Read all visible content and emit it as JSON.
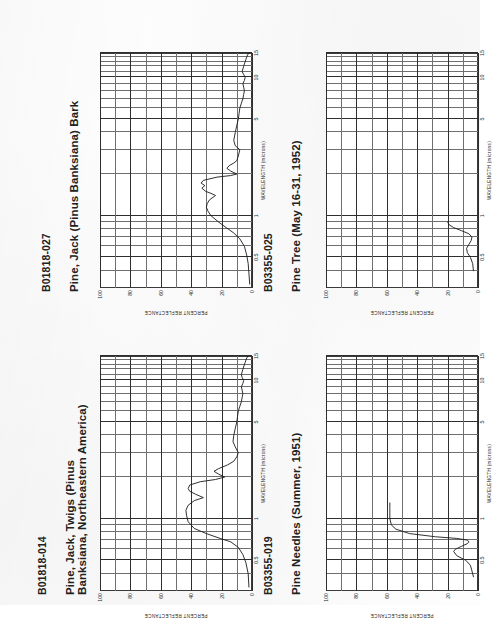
{
  "page": {
    "kind": "scanned-spectral-reflectance-catalog-page",
    "background_color": "#fdfdfd",
    "ink_color": "#212121",
    "orientation_note": "charts rotated 90 degrees counter-clockwise on page"
  },
  "axes_common": {
    "xlabel": "WAVELENGTH (microns)",
    "ylabel": "PERCENT REFLECTANCE",
    "xticks": [
      "0.5",
      "1",
      "5",
      "10",
      "15"
    ],
    "xtick_values": [
      0.5,
      1,
      5,
      10,
      15
    ],
    "yticks": [
      "0",
      "20",
      "40",
      "60",
      "80",
      "100"
    ],
    "ytick_values": [
      0,
      20,
      40,
      60,
      80,
      100
    ],
    "xlim": [
      0.3,
      15
    ],
    "ylim": [
      0,
      100
    ],
    "xscale": "log-to-linear segmented",
    "grid": true
  },
  "panels": [
    {
      "position": "top-left",
      "id_label": "B01818-027",
      "title": "Pine, Jack (Pinus Banksiana) Bark",
      "chart_data": {
        "type": "line",
        "title": "Pine, Jack (Pinus Banksiana) Bark",
        "xlabel": "WAVELENGTH (microns)",
        "ylabel": "PERCENT REFLECTANCE",
        "xlim": [
          0.3,
          15
        ],
        "ylim": [
          0,
          100
        ],
        "grid": true,
        "series": [
          {
            "name": "B01818-027",
            "x": [
              0.32,
              0.38,
              0.45,
              0.52,
              0.6,
              0.68,
              0.75,
              0.82,
              0.9,
              1.0,
              1.08,
              1.15,
              1.22,
              1.3,
              1.4,
              1.45,
              1.5,
              1.58,
              1.65,
              1.72,
              1.8,
              1.9,
              1.95,
              2.0,
              2.1,
              2.2,
              2.3,
              2.4,
              2.5,
              2.7,
              3.0,
              3.2,
              3.5,
              4.0,
              4.5,
              5.0,
              5.5,
              6.0,
              6.5,
              7.0,
              7.5,
              8.0,
              8.5,
              9.0,
              9.5,
              10.0,
              10.5,
              11.0,
              11.5,
              12.0,
              12.5,
              13.0,
              13.5,
              14.0,
              14.5,
              15.0
            ],
            "y": [
              1.5,
              2.0,
              2.5,
              3.5,
              5.0,
              8.0,
              12.0,
              17.0,
              22.0,
              27.0,
              29.0,
              30.0,
              29.5,
              28.0,
              24.0,
              27.0,
              30.5,
              33.0,
              31.0,
              33.5,
              32.0,
              23.0,
              14.0,
              10.0,
              14.0,
              16.5,
              15.0,
              12.0,
              10.0,
              9.0,
              8.0,
              11.0,
              12.0,
              11.0,
              10.0,
              9.0,
              8.5,
              8.0,
              7.0,
              6.0,
              5.5,
              5.0,
              5.5,
              6.0,
              5.0,
              4.5,
              5.5,
              6.5,
              6.0,
              5.5,
              5.0,
              4.5,
              4.0,
              3.5,
              3.0,
              2.0
            ]
          }
        ]
      }
    },
    {
      "position": "bottom-left",
      "id_label": "B01818-014",
      "title": "Pine, Jack, Twigs (Pinus",
      "title_line2": "Banksiana, Northeastern America)",
      "chart_data": {
        "type": "line",
        "title": "Pine, Jack, Twigs (Pinus Banksiana, Northeastern America)",
        "xlabel": "WAVELENGTH (microns)",
        "ylabel": "PERCENT REFLECTANCE",
        "xlim": [
          0.3,
          15
        ],
        "ylim": [
          0,
          100
        ],
        "grid": true,
        "series": [
          {
            "name": "B01818-014",
            "x": [
              0.32,
              0.4,
              0.48,
              0.55,
              0.62,
              0.68,
              0.72,
              0.78,
              0.85,
              0.95,
              1.05,
              1.15,
              1.25,
              1.35,
              1.42,
              1.5,
              1.58,
              1.65,
              1.75,
              1.85,
              1.92,
              2.0,
              2.1,
              2.2,
              2.3,
              2.45,
              2.6,
              2.8,
              3.0,
              3.3,
              3.6,
              4.0,
              4.5,
              5.0,
              5.5,
              6.0,
              6.5,
              7.0,
              7.5,
              8.0,
              8.5,
              9.0,
              9.5,
              10.0,
              10.5,
              11.0,
              11.5,
              12.0,
              12.5,
              13.0,
              13.5,
              14.0,
              14.5,
              15.0
            ],
            "y": [
              2.0,
              2.5,
              4.0,
              6.0,
              9.0,
              14.0,
              21.0,
              30.0,
              38.0,
              42.0,
              43.0,
              43.5,
              42.0,
              38.0,
              32.0,
              37.0,
              41.0,
              42.0,
              41.0,
              34.0,
              24.0,
              18.0,
              22.0,
              25.0,
              22.0,
              16.0,
              12.0,
              10.0,
              9.0,
              11.0,
              12.5,
              12.0,
              11.0,
              10.0,
              9.5,
              9.0,
              8.0,
              7.0,
              6.5,
              6.0,
              6.5,
              7.0,
              6.0,
              5.5,
              6.5,
              7.0,
              6.5,
              6.0,
              5.5,
              5.0,
              4.5,
              4.0,
              3.5,
              2.5
            ]
          }
        ]
      }
    },
    {
      "position": "top-right",
      "id_label": "B03355-025",
      "title": "Pine Tree (May 16-31, 1952)",
      "chart_data": {
        "type": "line",
        "title": "Pine Tree (May 16-31, 1952)",
        "xlabel": "WAVELENGTH (microns)",
        "ylabel": "PERCENT REFLECTANCE",
        "xlim": [
          0.3,
          15
        ],
        "ylim": [
          0,
          100
        ],
        "grid": true,
        "series": [
          {
            "name": "B03355-025",
            "x": [
              0.4,
              0.45,
              0.5,
              0.54,
              0.58,
              0.62,
              0.66,
              0.7,
              0.74,
              0.78,
              0.82,
              0.86,
              0.9
            ],
            "y": [
              3.0,
              3.5,
              5.0,
              7.0,
              7.5,
              6.0,
              4.5,
              4.0,
              6.0,
              11.0,
              16.0,
              19.0,
              20.0
            ]
          }
        ]
      }
    },
    {
      "position": "bottom-right",
      "id_label": "B03355-019",
      "title": "Pine Needles (Summer, 1951)",
      "chart_data": {
        "type": "line",
        "title": "Pine Needles (Summer, 1951)",
        "xlabel": "WAVELENGTH (microns)",
        "ylabel": "PERCENT REFLECTANCE",
        "xlim": [
          0.3,
          15
        ],
        "ylim": [
          0,
          100
        ],
        "grid": true,
        "series": [
          {
            "name": "B03355-019",
            "x": [
              0.38,
              0.42,
              0.46,
              0.5,
              0.54,
              0.58,
              0.6,
              0.63,
              0.66,
              0.68,
              0.7,
              0.72,
              0.74,
              0.78,
              0.84,
              0.9,
              1.0,
              1.1,
              1.2,
              1.3
            ],
            "y": [
              3.0,
              4.0,
              5.0,
              8.0,
              14.0,
              16.0,
              15.0,
              11.0,
              7.0,
              6.0,
              7.0,
              14.0,
              28.0,
              45.0,
              54.0,
              57.0,
              58.0,
              58.0,
              58.0,
              58.0
            ]
          }
        ]
      }
    }
  ]
}
